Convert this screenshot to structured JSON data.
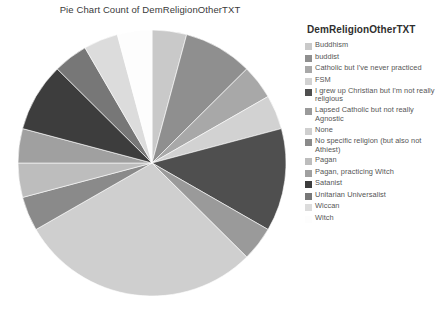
{
  "chart_data": {
    "type": "pie",
    "title": "Pie Chart Count of DemReligionOtherTXT",
    "legend_title": "DemReligionOtherTXT",
    "legend_position": "right",
    "grid": false,
    "categories": [
      "Buddhism",
      "buddist",
      "Catholic but I've never practiced",
      "FSM",
      "I grew up Christian but I'm not really religious",
      "Lapsed Catholic but not really Agnostic",
      "None",
      "No specific religion (but also not Athiest)",
      "Pagan",
      "Pagan, practicing Witch",
      "Satanist",
      "Unitarian Universalist",
      "Wiccan",
      "Witch"
    ],
    "values": [
      1,
      2,
      1,
      1,
      3,
      1,
      7,
      1,
      1,
      1,
      2,
      1,
      1,
      1
    ],
    "colors": [
      "#c9c9c9",
      "#8f8f8f",
      "#a8a8a8",
      "#d2d2d2",
      "#4f4f4f",
      "#9a9a9a",
      "#cfcfcf",
      "#8a8a8a",
      "#bdbdbd",
      "#a0a0a0",
      "#3d3d3d",
      "#777777",
      "#dcdcdc",
      "#fdfdfd"
    ],
    "start_angle_deg": 90,
    "direction": "clockwise",
    "total": 24
  }
}
